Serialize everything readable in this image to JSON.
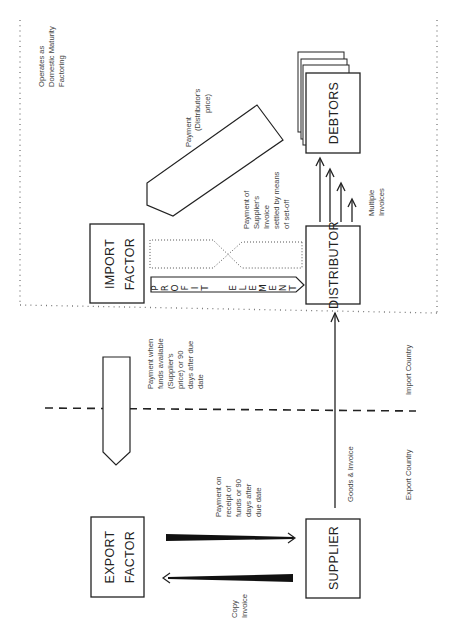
{
  "nodes": {
    "export_factor": [
      "EXPORT",
      "FACTOR"
    ],
    "supplier": "SUPPLIER",
    "import_factor": [
      "IMPORT",
      "FACTOR"
    ],
    "distributor": "DISTRIBUTOR",
    "debtors": "DEBTORS"
  },
  "labels": {
    "domestic": [
      "Operates as",
      "Domestic Maturity",
      "Factoring"
    ],
    "payment_distributor": [
      "Payment",
      "(Distributor's",
      "price)"
    ],
    "setoff": [
      "Payment of",
      "Supplier's",
      "Invoice",
      "settled by means",
      "of set-off"
    ],
    "multiple_invoices": [
      "Multiple",
      "Invoices"
    ],
    "payment_when_funds": [
      "Payment when",
      "funds available",
      "(Supplier's",
      "price) or 90",
      "days after due",
      "date"
    ],
    "payment_on_receipt": [
      "Payment on",
      "receipt of",
      "funds or 90",
      "days after",
      "due date"
    ],
    "copy_invoice": [
      "Copy",
      "Invoice"
    ],
    "goods_invoice": "Goods & Invoice",
    "import_country": "Import Country",
    "export_country": "Export Country",
    "profit_element": [
      "P",
      "R",
      "O",
      "F",
      "I",
      "T",
      "",
      "E",
      "L",
      "E",
      "M",
      "E",
      "N",
      "T"
    ]
  },
  "colors": {
    "ink": "#222222",
    "dotted": "#777777",
    "background": "#ffffff"
  }
}
